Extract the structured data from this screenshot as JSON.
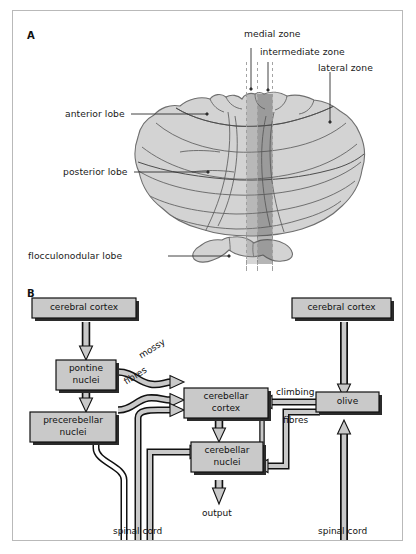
{
  "figure": {
    "panels": [
      {
        "letter": "A"
      },
      {
        "letter": "B"
      }
    ]
  },
  "panel_a": {
    "letter": "A",
    "labels": {
      "medial_zone": "medial zone",
      "intermediate_zone": "intermediate zone",
      "lateral_zone": "lateral zone",
      "anterior_lobe": "anterior lobe",
      "posterior_lobe": "posterior lobe",
      "flocculonodular_lobe": "flocculonodular lobe"
    },
    "colors": {
      "cerebellum_fill": "#d2d2d2",
      "cerebellum_outline": "#6a6a6a",
      "medial_band": "#aeaeae",
      "intermediate_band": "#8d8d8d",
      "dashed_line": "#9a9a9a",
      "leader_line": "#333333"
    }
  },
  "panel_b": {
    "letter": "B",
    "nodes": [
      {
        "id": "cerebral-cortex-left",
        "label": "cerebral cortex"
      },
      {
        "id": "cerebral-cortex-right",
        "label": "cerebral cortex"
      },
      {
        "id": "pontine-nuclei",
        "label_line1": "pontine",
        "label_line2": "nuclei"
      },
      {
        "id": "precerebellar-nuclei",
        "label_line1": "precerebellar",
        "label_line2": "nuclei"
      },
      {
        "id": "cerebellar-cortex",
        "label_line1": "cerebellar",
        "label_line2": "cortex"
      },
      {
        "id": "cerebellar-nuclei",
        "label_line1": "cerebellar",
        "label_line2": "nuclei"
      },
      {
        "id": "olive",
        "label": "olive"
      }
    ],
    "edge_labels": {
      "mossy": "mossy",
      "fibres_left": "fibres",
      "climbing": "climbing",
      "fibres_right": "fibres"
    },
    "terminal_labels": {
      "output": "output",
      "spinal_cord_left": "spinal cord",
      "spinal_cord_right": "spinal cord"
    },
    "colors": {
      "box_fill": "#c9c9c9",
      "box_stroke": "#111111",
      "box_shadow": "#2b2b2b",
      "arrow_fill": "#c9c9c9",
      "arrow_stroke": "#111111",
      "arrow_dark": "#1c1c1c"
    }
  }
}
